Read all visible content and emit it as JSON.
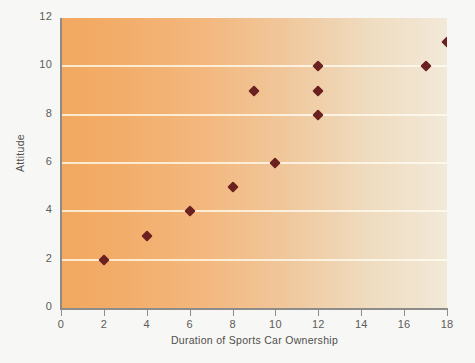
{
  "chart_data": {
    "type": "scatter",
    "title": "",
    "xlabel": "Duration of Sports Car Ownership",
    "ylabel": "Attitude",
    "xlim": [
      0,
      18
    ],
    "ylim": [
      0,
      12
    ],
    "xticks": [
      0,
      2,
      4,
      6,
      8,
      10,
      12,
      14,
      16,
      18
    ],
    "yticks": [
      0,
      2,
      4,
      6,
      8,
      10,
      12
    ],
    "grid": "horizontal",
    "legend": "none",
    "marker": "diamond",
    "marker_color": "#6b2120",
    "points": [
      {
        "x": 2,
        "y": 2
      },
      {
        "x": 4,
        "y": 3
      },
      {
        "x": 6,
        "y": 4
      },
      {
        "x": 8,
        "y": 5
      },
      {
        "x": 9,
        "y": 9
      },
      {
        "x": 10,
        "y": 6
      },
      {
        "x": 12,
        "y": 8
      },
      {
        "x": 12,
        "y": 9
      },
      {
        "x": 12,
        "y": 10
      },
      {
        "x": 17,
        "y": 10
      },
      {
        "x": 18,
        "y": 11
      }
    ],
    "gridline_values": [
      2,
      4,
      6,
      8,
      10
    ],
    "background_gradient": {
      "from": "#f2a85f",
      "to": "#f2e9d8",
      "direction": "left-to-right"
    },
    "axis_color": "#8d8c88",
    "gridline_color": "#fffcf0",
    "page_background": "#f7f7f5"
  },
  "xtick_labels": [
    "0",
    "2",
    "4",
    "6",
    "8",
    "10",
    "12",
    "14",
    "16",
    "18"
  ],
  "ytick_labels": [
    "0",
    "2",
    "4",
    "6",
    "8",
    "10",
    "12"
  ]
}
